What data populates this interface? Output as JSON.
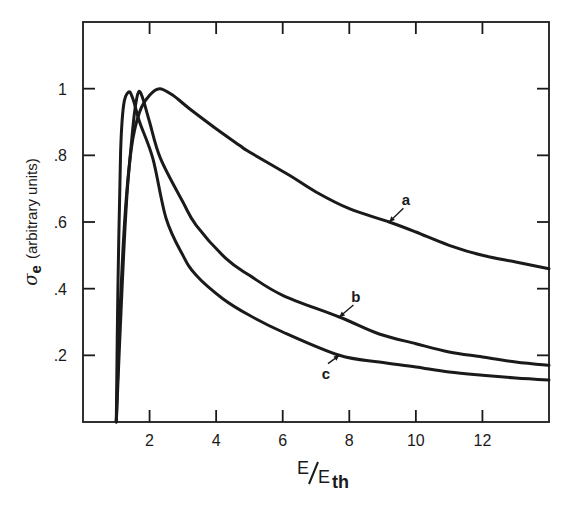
{
  "chart_data": {
    "type": "line",
    "title": "",
    "xlabel": "E/E_th",
    "xlabel_main": "E",
    "xlabel_denominator": "E",
    "xlabel_subscript": "th",
    "ylabel": "σe (arbitrary units)",
    "ylabel_symbol": "σ",
    "ylabel_subscript": "e",
    "ylabel_units": "(arbitrary units)",
    "xlim": [
      0,
      14
    ],
    "ylim": [
      0,
      1.2
    ],
    "grid": false,
    "legend": "inline labels with arrows",
    "x_ticks": [
      2,
      4,
      6,
      8,
      10,
      12
    ],
    "x_tick_labels": [
      "2",
      "4",
      "6",
      "8",
      "10",
      "12"
    ],
    "y_ticks": [
      0.2,
      0.4,
      0.6,
      0.8,
      1.0
    ],
    "y_tick_labels": [
      ".2",
      ".4",
      ".6",
      ".8",
      "1"
    ],
    "series": [
      {
        "name": "a",
        "label_pos": {
          "E": 9.7,
          "sigma": 0.65
        },
        "arrow_tip": {
          "E": 9.2,
          "sigma": 0.6
        },
        "points": [
          [
            1.0,
            0.0
          ],
          [
            1.1,
            0.3
          ],
          [
            1.25,
            0.6
          ],
          [
            1.45,
            0.82
          ],
          [
            1.7,
            0.93
          ],
          [
            2.0,
            0.98
          ],
          [
            2.3,
            1.0
          ],
          [
            2.7,
            0.98
          ],
          [
            3.2,
            0.94
          ],
          [
            4.0,
            0.88
          ],
          [
            4.7,
            0.83
          ],
          [
            5.0,
            0.81
          ],
          [
            6.2,
            0.74
          ],
          [
            7.0,
            0.69
          ],
          [
            8.0,
            0.64
          ],
          [
            9.2,
            0.6
          ],
          [
            10.0,
            0.57
          ],
          [
            11.0,
            0.53
          ],
          [
            12.0,
            0.5
          ],
          [
            13.0,
            0.48
          ],
          [
            14.0,
            0.46
          ]
        ]
      },
      {
        "name": "b",
        "label_pos": {
          "E": 8.2,
          "sigma": 0.36
        },
        "arrow_tip": {
          "E": 7.7,
          "sigma": 0.315
        },
        "points": [
          [
            1.0,
            0.0
          ],
          [
            1.15,
            0.35
          ],
          [
            1.3,
            0.65
          ],
          [
            1.43,
            0.81
          ],
          [
            1.55,
            0.93
          ],
          [
            1.67,
            0.99
          ],
          [
            1.8,
            0.97
          ],
          [
            2.0,
            0.9
          ],
          [
            2.33,
            0.79
          ],
          [
            3.0,
            0.66
          ],
          [
            3.4,
            0.59
          ],
          [
            4.3,
            0.49
          ],
          [
            5.0,
            0.44
          ],
          [
            6.0,
            0.38
          ],
          [
            7.7,
            0.315
          ],
          [
            8.9,
            0.264
          ],
          [
            10.0,
            0.235
          ],
          [
            11.0,
            0.21
          ],
          [
            12.0,
            0.195
          ],
          [
            13.0,
            0.18
          ],
          [
            14.0,
            0.17
          ]
        ]
      },
      {
        "name": "c",
        "label_pos": {
          "E": 7.3,
          "sigma": 0.13
        },
        "arrow_tip": {
          "E": 7.7,
          "sigma": 0.2
        },
        "points": [
          [
            1.0,
            0.0
          ],
          [
            1.05,
            0.4
          ],
          [
            1.13,
            0.81
          ],
          [
            1.22,
            0.95
          ],
          [
            1.37,
            0.99
          ],
          [
            1.5,
            0.97
          ],
          [
            1.7,
            0.9
          ],
          [
            2.1,
            0.79
          ],
          [
            2.5,
            0.61
          ],
          [
            3.0,
            0.5
          ],
          [
            3.4,
            0.44
          ],
          [
            4.2,
            0.37
          ],
          [
            5.0,
            0.32
          ],
          [
            6.0,
            0.27
          ],
          [
            7.7,
            0.2
          ],
          [
            8.9,
            0.18
          ],
          [
            10.0,
            0.165
          ],
          [
            11.0,
            0.15
          ],
          [
            12.0,
            0.14
          ],
          [
            13.0,
            0.132
          ],
          [
            14.0,
            0.126
          ]
        ]
      }
    ]
  },
  "layout": {
    "plot_left": 83,
    "plot_right": 549,
    "plot_top": 22,
    "plot_bottom": 422,
    "ink_color": "#1a1a1a",
    "background": "#ffffff"
  }
}
